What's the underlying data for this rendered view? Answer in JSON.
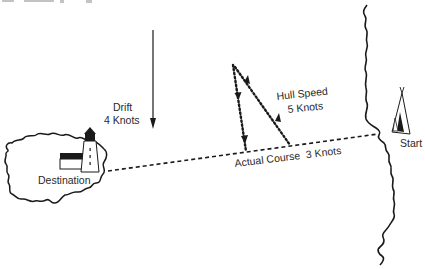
{
  "diagram": {
    "clipped_caption_fragment": "",
    "drift": {
      "title": "Drift",
      "speed": "4 Knots",
      "direction": "down"
    },
    "hull_speed": {
      "title": "Hull Speed",
      "speed": "5 Knots"
    },
    "actual_course": {
      "label": "Actual Course  3 Knots"
    },
    "destination": {
      "label": "Destination",
      "icons": [
        "island-icon",
        "lighthouse-icon",
        "house-icon"
      ]
    },
    "start": {
      "label": "Start",
      "icons": [
        "tent-icon",
        "coastline-icon"
      ]
    },
    "colors": {
      "ink": "#1a1a1a",
      "background": "#ffffff"
    }
  }
}
